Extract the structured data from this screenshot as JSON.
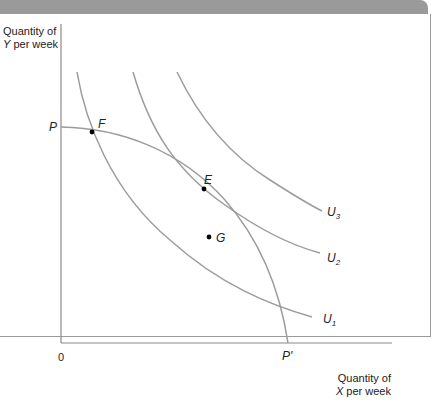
{
  "diagram": {
    "y_axis_label_line1": "Quantity of",
    "y_axis_label_line2_var": "Y",
    "y_axis_label_line2_rest": " per week",
    "x_axis_label_line1": "Quantity of",
    "x_axis_label_line2_var": "X",
    "x_axis_label_line2_rest": " per week",
    "origin": "0",
    "ppf_start_label": "P",
    "ppf_end_label": "P'",
    "points": {
      "F": "F",
      "E": "E",
      "G": "G"
    },
    "curves": {
      "U1": {
        "base": "U",
        "sub": "1"
      },
      "U2": {
        "base": "U",
        "sub": "2"
      },
      "U3": {
        "base": "U",
        "sub": "3"
      }
    },
    "colors": {
      "curve": "#9c9c9c",
      "axis": "#8a8a8a",
      "point": "#000000",
      "frame": "#9a9a9a"
    }
  }
}
